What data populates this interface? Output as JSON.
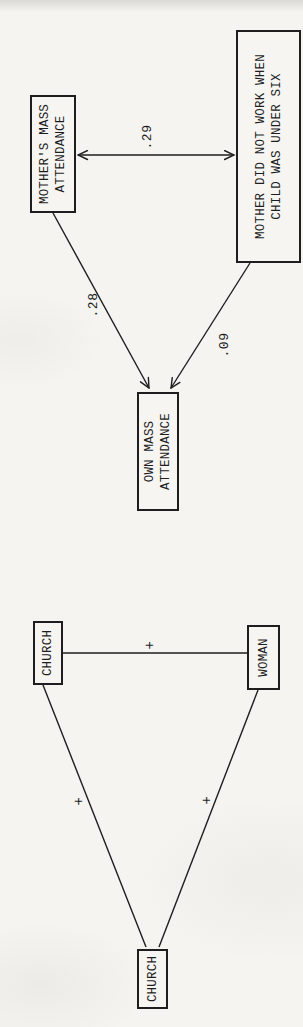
{
  "page": {
    "background": "#f5f4f1",
    "ink": "#1e1e1e"
  },
  "path_diagram": {
    "nodes": {
      "mothers_mass": {
        "lines": [
          "MOTHER'S MASS",
          "ATTENDANCE"
        ]
      },
      "mother_work": {
        "lines": [
          "MOTHER DID NOT WORK WHEN",
          "CHILD WAS UNDER SIX"
        ]
      },
      "own_mass": {
        "lines": [
          "OWN MASS",
          "ATTENDANCE"
        ]
      }
    },
    "edges": [
      {
        "from": "mothers_mass",
        "to": "mother_work",
        "style": "double-headed-arrow",
        "label": ".29"
      },
      {
        "from": "mothers_mass",
        "to": "own_mass",
        "style": "arrow",
        "label": ".28"
      },
      {
        "from": "mother_work",
        "to": "own_mass",
        "style": "arrow",
        "label": ".09"
      }
    ]
  },
  "triangle_diagram": {
    "nodes": {
      "church_top": "CHURCH",
      "woman": "WOMAN",
      "church_left": "CHURCH"
    },
    "edges": [
      {
        "from": "church_top",
        "to": "woman",
        "style": "line",
        "label": "+"
      },
      {
        "from": "church_top",
        "to": "church_left",
        "style": "line",
        "label": "+"
      },
      {
        "from": "woman",
        "to": "church_left",
        "style": "line",
        "label": "+"
      }
    ]
  }
}
